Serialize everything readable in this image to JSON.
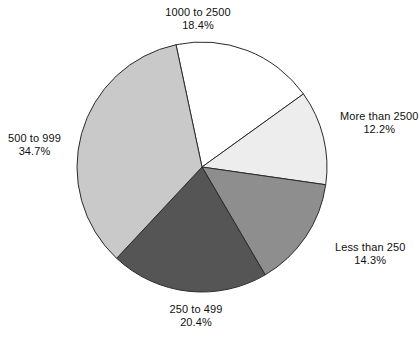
{
  "chart_data": {
    "type": "pie",
    "title": "",
    "subtitle": "",
    "xlabel": "",
    "ylabel": "",
    "legend_position": "none",
    "grid": false,
    "label_format": "category name above percentage",
    "start_angle_deg": -102,
    "direction": "clockwise",
    "categories": [
      "1000 to 2500",
      "More than 2500",
      "Less than 250",
      "250 to 499",
      "500 to 999"
    ],
    "values": [
      18.4,
      12.2,
      14.3,
      20.4,
      34.7
    ],
    "percent_labels": [
      "18.4%",
      "12.2%",
      "14.3%",
      "20.4%",
      "34.7%"
    ],
    "colors": [
      "#ffffff",
      "#ededed",
      "#8e8e8e",
      "#555555",
      "#c9c9c9"
    ],
    "slice_border_color": "#2b2b2b",
    "slices": [
      {
        "label": "1000 to 2500",
        "percent_text": "18.4%",
        "value": 18.4,
        "color": "#ffffff"
      },
      {
        "label": "More than 2500",
        "percent_text": "12.2%",
        "value": 12.2,
        "color": "#ededed"
      },
      {
        "label": "Less than 250",
        "percent_text": "14.3%",
        "value": 14.3,
        "color": "#8e8e8e"
      },
      {
        "label": "250 to 499",
        "percent_text": "20.4%",
        "value": 20.4,
        "color": "#555555"
      },
      {
        "label": "500 to 999",
        "percent_text": "34.7%",
        "value": 34.7,
        "color": "#c9c9c9"
      }
    ]
  },
  "caption": {
    "clipped_text": ""
  }
}
